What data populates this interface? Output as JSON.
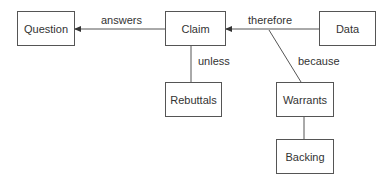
{
  "diagram": {
    "nodes": {
      "question": "Question",
      "claim": "Claim",
      "data": "Data",
      "rebuttals": "Rebuttals",
      "warrants": "Warrants",
      "backing": "Backing"
    },
    "edges": {
      "answers": "answers",
      "therefore": "therefore",
      "unless": "unless",
      "because": "because"
    },
    "colors": {
      "stroke": "#555555",
      "text": "#333333",
      "background": "#ffffff"
    }
  }
}
